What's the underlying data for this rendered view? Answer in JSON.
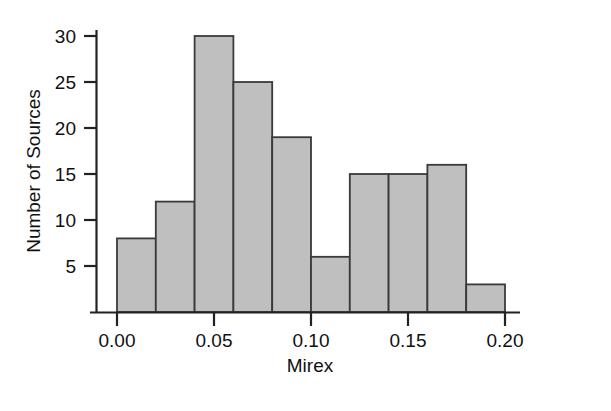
{
  "chart_data": {
    "type": "bar",
    "title": "",
    "subtitle": "",
    "xlabel": "Mirex",
    "ylabel": "Number of Sources",
    "bin_width": 0.02,
    "bin_edges": [
      0.0,
      0.02,
      0.04,
      0.06,
      0.08,
      0.1,
      0.12,
      0.14,
      0.16,
      0.18,
      0.2
    ],
    "categories": [
      "0.00-0.02",
      "0.02-0.04",
      "0.04-0.06",
      "0.06-0.08",
      "0.08-0.10",
      "0.10-0.12",
      "0.12-0.14",
      "0.14-0.16",
      "0.16-0.18",
      "0.18-0.20"
    ],
    "x": [
      0.01,
      0.03,
      0.05,
      0.07,
      0.09,
      0.11,
      0.13,
      0.15,
      0.17,
      0.19
    ],
    "values": [
      8,
      12,
      30,
      25,
      19,
      6,
      15,
      15,
      16,
      3
    ],
    "xlim": [
      0.0,
      0.2
    ],
    "ylim": [
      0,
      32
    ],
    "xticks": [
      0.0,
      0.05,
      0.1,
      0.15,
      0.2
    ],
    "xtick_labels": [
      "0.00",
      "0.05",
      "0.10",
      "0.15",
      "0.20"
    ],
    "yticks": [
      5,
      10,
      15,
      20,
      25,
      30
    ],
    "ytick_labels": [
      "5",
      "10",
      "15",
      "20",
      "25",
      "30"
    ],
    "grid": false,
    "legend": null,
    "legend_position": "none",
    "annotations": [],
    "colors": {
      "bar_fill": "#bfbfbf",
      "bar_stroke": "#3a3a3a",
      "axis": "#222222",
      "text": "#111111",
      "background": "#ffffff"
    }
  },
  "axes": {
    "y_title": "Number of Sources",
    "x_title": "Mirex",
    "y_tick_labels": [
      "5",
      "10",
      "15",
      "20",
      "25",
      "30"
    ],
    "x_tick_labels": [
      "0.00",
      "0.05",
      "0.10",
      "0.15",
      "0.20"
    ]
  }
}
